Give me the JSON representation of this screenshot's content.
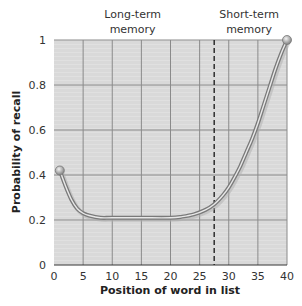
{
  "chart_data": {
    "type": "line",
    "title": "",
    "xlabel": "Position of word in list",
    "ylabel": "Probability of recall",
    "xlim": [
      0,
      40
    ],
    "ylim": [
      0,
      1
    ],
    "x_ticks": [
      0,
      5,
      10,
      15,
      20,
      25,
      30,
      35,
      40
    ],
    "y_ticks": [
      0,
      0.2,
      0.4,
      0.6,
      0.8,
      1
    ],
    "y_tick_labels": [
      "0",
      "0.2",
      "0.4",
      "0.6",
      "0.8",
      "1"
    ],
    "grid": true,
    "legend": null,
    "series": [
      {
        "name": "Serial position curve",
        "x": [
          1,
          2,
          3,
          4,
          5,
          6,
          8,
          10,
          15,
          20,
          22,
          24,
          26,
          27.5,
          29,
          30,
          31,
          32,
          33,
          34,
          35,
          36,
          37,
          38,
          39,
          40
        ],
        "y": [
          0.42,
          0.35,
          0.29,
          0.25,
          0.23,
          0.22,
          0.21,
          0.21,
          0.21,
          0.21,
          0.215,
          0.225,
          0.245,
          0.27,
          0.31,
          0.345,
          0.39,
          0.44,
          0.5,
          0.56,
          0.63,
          0.71,
          0.79,
          0.87,
          0.94,
          1.0
        ]
      }
    ],
    "annotations": [
      {
        "text": "Long-term memory",
        "lines": [
          "Long-term",
          "memory"
        ],
        "x": 13.5,
        "position": "above plot"
      },
      {
        "text": "Short-term memory",
        "lines": [
          "Short-term",
          "memory"
        ],
        "x": 33.5,
        "position": "above plot"
      },
      {
        "type": "vertical-dashed-line",
        "x": 27.5,
        "meaning": "boundary between long-term and short-term memory"
      }
    ],
    "colors": {
      "plot_background": "#d9d9d9",
      "grid": "#8a8a8a",
      "curve": "#7a7a7a",
      "curve_highlight": "#e8e8e8",
      "dashed_line": "#222222"
    }
  }
}
